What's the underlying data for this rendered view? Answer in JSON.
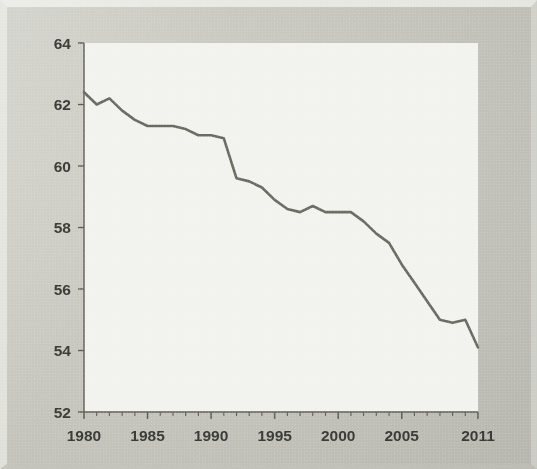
{
  "figure": {
    "background_color": "#c7c7bf",
    "plot_background_color": "#f2f2ee",
    "line_color": "#6b6b64",
    "axis_color": "#5e5e58",
    "label_color": "#3b3b38"
  },
  "ghost_marks": [
    {
      "text": "the labor force participation",
      "x": 118,
      "y": 152,
      "size": 13
    },
    {
      "text": "rate has been declining",
      "x": 262,
      "y": 152,
      "size": 13
    },
    {
      "text": "since about 1980 for",
      "x": 130,
      "y": 178,
      "size": 13
    },
    {
      "text": "men and",
      "x": 300,
      "y": 178,
      "size": 13
    },
    {
      "text": "recent years",
      "x": 150,
      "y": 205,
      "size": 13
    },
    {
      "text": "overall",
      "x": 300,
      "y": 205,
      "size": 13
    },
    {
      "text": "trend",
      "x": 215,
      "y": 240,
      "size": 13
    }
  ],
  "chart_data": {
    "type": "line",
    "title": "",
    "subtitle": "",
    "xlabel": "",
    "ylabel": "",
    "xlim": [
      1980,
      2011
    ],
    "ylim": [
      52,
      64
    ],
    "y_ticks": [
      52,
      54,
      56,
      58,
      60,
      62,
      64
    ],
    "y_tick_labels": [
      "52",
      "54",
      "56",
      "58",
      "60",
      "62",
      "64"
    ],
    "x_ticks": [
      1980,
      1985,
      1990,
      1995,
      2000,
      2005,
      2011
    ],
    "x_tick_labels": [
      "1980",
      "1985",
      "1990",
      "1995",
      "2000",
      "2005",
      "2011"
    ],
    "x_minor_tick_interval": 1,
    "grid": false,
    "legend": null,
    "legend_position": "none",
    "series": [
      {
        "name": "value",
        "color": "#6b6b64",
        "line_width": 2.6,
        "x": [
          1980,
          1981,
          1982,
          1983,
          1984,
          1985,
          1986,
          1987,
          1988,
          1989,
          1990,
          1991,
          1992,
          1993,
          1994,
          1995,
          1996,
          1997,
          1998,
          1999,
          2000,
          2001,
          2002,
          2003,
          2004,
          2005,
          2006,
          2007,
          2008,
          2009,
          2010,
          2011
        ],
        "values": [
          62.4,
          62.0,
          62.2,
          61.8,
          61.5,
          61.3,
          61.3,
          61.3,
          61.2,
          61.0,
          61.0,
          60.9,
          59.6,
          59.5,
          59.3,
          58.9,
          58.6,
          58.5,
          58.7,
          58.5,
          58.5,
          58.5,
          58.2,
          57.8,
          57.5,
          56.8,
          56.2,
          55.6,
          55.0,
          54.9,
          55.0,
          54.1
        ]
      }
    ]
  }
}
